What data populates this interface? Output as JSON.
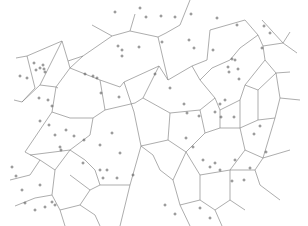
{
  "diagram": {
    "type": "voronoi",
    "width": 308,
    "height": 226,
    "background": "#ffffff",
    "edge_color": "#8a8a8a",
    "site_color": "#555555",
    "site_marker": "plus",
    "edges": [
      [
        92,
        25,
        112,
        36
      ],
      [
        112,
        36,
        130,
        31
      ],
      [
        130,
        31,
        135,
        14
      ],
      [
        130,
        31,
        158,
        37
      ],
      [
        158,
        37,
        166,
        33
      ],
      [
        166,
        33,
        180,
        25
      ],
      [
        158,
        37,
        168,
        80
      ],
      [
        112,
        36,
        83,
        56
      ],
      [
        83,
        56,
        68,
        61
      ],
      [
        68,
        61,
        62,
        41
      ],
      [
        62,
        41,
        40,
        85
      ],
      [
        40,
        85,
        22,
        102
      ],
      [
        22,
        102,
        14,
        100
      ],
      [
        40,
        85,
        56,
        87
      ],
      [
        56,
        87,
        70,
        68
      ],
      [
        70,
        68,
        83,
        56
      ],
      [
        56,
        87,
        52,
        112
      ],
      [
        52,
        112,
        25,
        152
      ],
      [
        68,
        61,
        70,
        68
      ],
      [
        56,
        87,
        58,
        88
      ],
      [
        62,
        41,
        27,
        56
      ],
      [
        27,
        56,
        16,
        58
      ],
      [
        27,
        56,
        35,
        88
      ],
      [
        35,
        88,
        22,
        102
      ],
      [
        70,
        68,
        100,
        80
      ],
      [
        100,
        80,
        120,
        87
      ],
      [
        120,
        87,
        124,
        82
      ],
      [
        124,
        82,
        159,
        66
      ],
      [
        159,
        66,
        168,
        80
      ],
      [
        168,
        80,
        192,
        66
      ],
      [
        192,
        66,
        207,
        60
      ],
      [
        100,
        80,
        105,
        110
      ],
      [
        105,
        110,
        135,
        103
      ],
      [
        135,
        103,
        143,
        98
      ],
      [
        143,
        98,
        159,
        66
      ],
      [
        124,
        82,
        134,
        112
      ],
      [
        134,
        112,
        141,
        146
      ],
      [
        141,
        146,
        153,
        155
      ],
      [
        105,
        110,
        93,
        118
      ],
      [
        93,
        118,
        90,
        135
      ],
      [
        90,
        135,
        70,
        150
      ],
      [
        70,
        150,
        30,
        155
      ],
      [
        52,
        112,
        70,
        118
      ],
      [
        70,
        118,
        93,
        118
      ],
      [
        180,
        25,
        190,
        0
      ],
      [
        207,
        60,
        210,
        30
      ],
      [
        210,
        30,
        245,
        20
      ],
      [
        245,
        20,
        258,
        35
      ],
      [
        258,
        35,
        263,
        46
      ],
      [
        263,
        46,
        265,
        60
      ],
      [
        192,
        66,
        200,
        80
      ],
      [
        200,
        80,
        212,
        68
      ],
      [
        212,
        68,
        230,
        60
      ],
      [
        230,
        60,
        240,
        48
      ],
      [
        240,
        48,
        258,
        35
      ],
      [
        200,
        80,
        215,
        98
      ],
      [
        215,
        98,
        220,
        110
      ],
      [
        220,
        110,
        240,
        100
      ],
      [
        240,
        100,
        245,
        85
      ],
      [
        245,
        85,
        265,
        60
      ],
      [
        263,
        46,
        283,
        43
      ],
      [
        283,
        43,
        297,
        53
      ],
      [
        262,
        20,
        283,
        43
      ],
      [
        283,
        43,
        290,
        32
      ],
      [
        265,
        60,
        276,
        73
      ],
      [
        276,
        73,
        290,
        72
      ],
      [
        276,
        73,
        280,
        98
      ],
      [
        280,
        98,
        300,
        100
      ],
      [
        280,
        98,
        275,
        118
      ],
      [
        245,
        85,
        258,
        90
      ],
      [
        258,
        90,
        276,
        73
      ],
      [
        258,
        90,
        258,
        120
      ],
      [
        258,
        120,
        275,
        118
      ],
      [
        143,
        98,
        170,
        113
      ],
      [
        170,
        113,
        168,
        140
      ],
      [
        168,
        140,
        141,
        146
      ],
      [
        170,
        113,
        200,
        110
      ],
      [
        200,
        110,
        215,
        98
      ],
      [
        200,
        110,
        205,
        133
      ],
      [
        205,
        133,
        220,
        128
      ],
      [
        220,
        128,
        220,
        110
      ],
      [
        220,
        128,
        240,
        128
      ],
      [
        240,
        128,
        240,
        100
      ],
      [
        240,
        128,
        258,
        120
      ],
      [
        240,
        128,
        245,
        150
      ],
      [
        245,
        150,
        263,
        158
      ],
      [
        263,
        158,
        275,
        118
      ],
      [
        263,
        158,
        290,
        150
      ],
      [
        168,
        140,
        186,
        152
      ],
      [
        186,
        152,
        205,
        133
      ],
      [
        186,
        152,
        200,
        175
      ],
      [
        200,
        175,
        230,
        170
      ],
      [
        230,
        170,
        245,
        150
      ],
      [
        141,
        146,
        130,
        185
      ],
      [
        130,
        185,
        120,
        226
      ],
      [
        153,
        155,
        160,
        170
      ],
      [
        160,
        170,
        173,
        180
      ],
      [
        173,
        180,
        186,
        152
      ],
      [
        173,
        180,
        180,
        205
      ],
      [
        180,
        205,
        200,
        200
      ],
      [
        200,
        200,
        200,
        175
      ],
      [
        200,
        200,
        215,
        210
      ],
      [
        215,
        210,
        230,
        200
      ],
      [
        230,
        200,
        230,
        170
      ],
      [
        230,
        170,
        255,
        170
      ],
      [
        255,
        170,
        263,
        158
      ],
      [
        255,
        170,
        260,
        185
      ],
      [
        260,
        185,
        280,
        200
      ],
      [
        25,
        152,
        40,
        160
      ],
      [
        40,
        160,
        55,
        170
      ],
      [
        55,
        170,
        70,
        150
      ],
      [
        55,
        170,
        52,
        195
      ],
      [
        52,
        195,
        35,
        198
      ],
      [
        35,
        198,
        15,
        206
      ],
      [
        52,
        195,
        60,
        210
      ],
      [
        60,
        210,
        80,
        205
      ],
      [
        80,
        205,
        90,
        190
      ],
      [
        90,
        190,
        70,
        175
      ],
      [
        90,
        190,
        100,
        185
      ],
      [
        100,
        185,
        130,
        185
      ],
      [
        60,
        210,
        65,
        226
      ],
      [
        80,
        205,
        95,
        215
      ],
      [
        95,
        215,
        100,
        226
      ],
      [
        40,
        160,
        30,
        175
      ],
      [
        30,
        175,
        10,
        180
      ],
      [
        85,
        160,
        95,
        170
      ],
      [
        95,
        170,
        100,
        185
      ],
      [
        85,
        160,
        70,
        150
      ],
      [
        180,
        205,
        190,
        226
      ],
      [
        215,
        210,
        222,
        226
      ],
      [
        230,
        200,
        245,
        210
      ]
    ],
    "sites": [
      [
        115,
        12
      ],
      [
        140,
        8
      ],
      [
        146,
        17
      ],
      [
        161,
        16
      ],
      [
        175,
        17
      ],
      [
        191,
        14
      ],
      [
        217,
        18
      ],
      [
        237,
        25
      ],
      [
        264,
        26
      ],
      [
        270,
        33
      ],
      [
        262,
        48
      ],
      [
        118,
        46
      ],
      [
        122,
        50
      ],
      [
        122,
        56
      ],
      [
        34,
        63
      ],
      [
        43,
        65
      ],
      [
        36,
        70
      ],
      [
        40,
        68
      ],
      [
        44,
        69
      ],
      [
        45,
        72
      ],
      [
        20,
        76
      ],
      [
        27,
        78
      ],
      [
        85,
        74
      ],
      [
        93,
        76
      ],
      [
        97,
        78
      ],
      [
        139,
        47
      ],
      [
        162,
        42
      ],
      [
        189,
        40
      ],
      [
        194,
        48
      ],
      [
        213,
        50
      ],
      [
        232,
        59
      ],
      [
        235,
        60
      ],
      [
        228,
        67
      ],
      [
        238,
        69
      ],
      [
        229,
        72
      ],
      [
        239,
        79
      ],
      [
        101,
        93
      ],
      [
        119,
        97
      ],
      [
        155,
        74
      ],
      [
        170,
        88
      ],
      [
        184,
        104
      ],
      [
        187,
        113
      ],
      [
        199,
        116
      ],
      [
        215,
        112
      ],
      [
        220,
        104
      ],
      [
        221,
        117
      ],
      [
        225,
        100
      ],
      [
        234,
        117
      ],
      [
        254,
        134
      ],
      [
        260,
        126
      ],
      [
        39,
        98
      ],
      [
        48,
        100
      ],
      [
        52,
        106
      ],
      [
        40,
        121
      ],
      [
        49,
        125
      ],
      [
        55,
        135
      ],
      [
        60,
        147
      ],
      [
        12,
        167
      ],
      [
        16,
        176
      ],
      [
        66,
        130
      ],
      [
        61,
        150
      ],
      [
        74,
        136
      ],
      [
        84,
        140
      ],
      [
        100,
        145
      ],
      [
        112,
        133
      ],
      [
        120,
        153
      ],
      [
        107,
        170
      ],
      [
        117,
        178
      ],
      [
        133,
        175
      ],
      [
        83,
        163
      ],
      [
        100,
        170
      ],
      [
        103,
        178
      ],
      [
        186,
        138
      ],
      [
        193,
        147
      ],
      [
        203,
        160
      ],
      [
        210,
        167
      ],
      [
        215,
        163
      ],
      [
        220,
        170
      ],
      [
        235,
        160
      ],
      [
        232,
        181
      ],
      [
        244,
        180
      ],
      [
        250,
        168
      ],
      [
        266,
        152
      ],
      [
        40,
        185
      ],
      [
        22,
        190
      ],
      [
        25,
        203
      ],
      [
        35,
        210
      ],
      [
        45,
        207
      ],
      [
        52,
        202
      ],
      [
        55,
        205
      ],
      [
        165,
        205
      ],
      [
        175,
        214
      ],
      [
        200,
        208
      ],
      [
        210,
        218
      ]
    ]
  }
}
